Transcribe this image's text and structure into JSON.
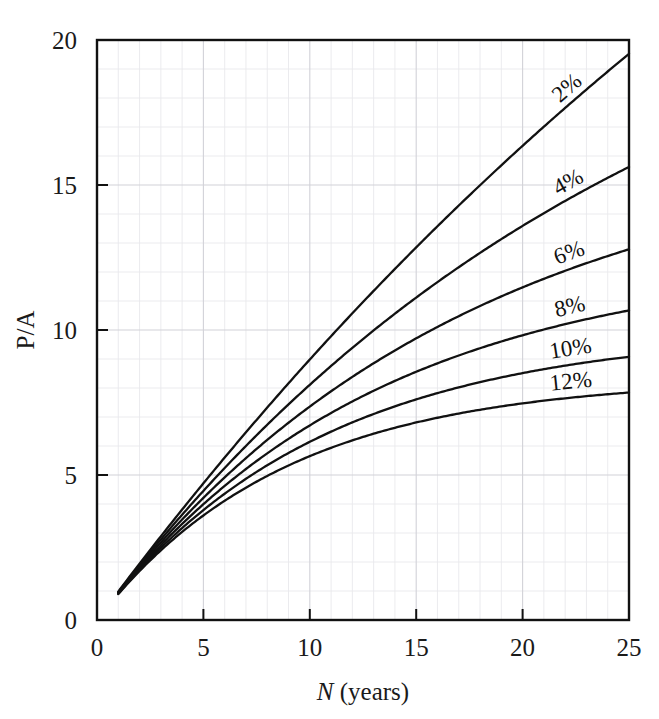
{
  "figure": {
    "background_color": "#ffffff",
    "ink_color": "#111111",
    "grid_minor_color": "#e9e9ec",
    "grid_major_color": "#d2d2d8"
  },
  "chart_data": {
    "type": "line",
    "title": "",
    "subtitle": "",
    "xlabel": "N (years)",
    "xlabel_italic_part": "N",
    "xlabel_rest": " (years)",
    "ylabel": "P/A",
    "xlim": [
      0,
      25
    ],
    "ylim": [
      0,
      20
    ],
    "xticks": [
      0,
      5,
      10,
      15,
      20,
      25
    ],
    "xtick_labels": [
      "0",
      "5",
      "10",
      "15",
      "20",
      "25"
    ],
    "yticks": [
      0,
      5,
      10,
      15,
      20
    ],
    "ytick_labels": [
      "0",
      "5",
      "10",
      "15",
      "20"
    ],
    "x_minor_step": 1,
    "y_minor_step": 1,
    "grid": true,
    "grid_style": "minor and major gridlines, light gray",
    "legend": "inline curve labels at right end of each curve",
    "legend_position": "inline-right",
    "x": [
      1,
      2,
      3,
      4,
      5,
      6,
      7,
      8,
      9,
      10,
      11,
      12,
      13,
      14,
      15,
      16,
      17,
      18,
      19,
      20,
      21,
      22,
      23,
      24,
      25
    ],
    "series": [
      {
        "name": "2%",
        "label": "2%",
        "rate": 0.02,
        "values": [
          0.98,
          1.94,
          2.88,
          3.81,
          4.71,
          5.6,
          6.47,
          7.33,
          8.16,
          8.98,
          9.79,
          10.58,
          11.35,
          12.11,
          12.85,
          13.58,
          14.29,
          14.99,
          15.68,
          16.35,
          17.01,
          17.66,
          18.29,
          18.91,
          19.52
        ]
      },
      {
        "name": "4%",
        "label": "4%",
        "rate": 0.04,
        "values": [
          0.96,
          1.89,
          2.78,
          3.63,
          4.45,
          5.24,
          6.0,
          6.73,
          7.44,
          8.11,
          8.76,
          9.39,
          9.99,
          10.56,
          11.12,
          11.65,
          12.17,
          12.66,
          13.13,
          13.59,
          14.03,
          14.45,
          14.86,
          15.25,
          15.62
        ]
      },
      {
        "name": "6%",
        "label": "6%",
        "rate": 0.06,
        "values": [
          0.94,
          1.83,
          2.67,
          3.47,
          4.21,
          4.92,
          5.58,
          6.21,
          6.8,
          7.36,
          7.89,
          8.38,
          8.85,
          9.29,
          9.71,
          10.11,
          10.48,
          10.83,
          11.16,
          11.47,
          11.76,
          12.04,
          12.3,
          12.55,
          12.78
        ]
      },
      {
        "name": "8%",
        "label": "8%",
        "rate": 0.08,
        "values": [
          0.93,
          1.78,
          2.58,
          3.31,
          3.99,
          4.62,
          5.21,
          5.75,
          6.25,
          6.71,
          7.14,
          7.54,
          7.9,
          8.24,
          8.56,
          8.85,
          9.12,
          9.37,
          9.6,
          9.82,
          10.02,
          10.2,
          10.37,
          10.53,
          10.67
        ]
      },
      {
        "name": "10%",
        "label": "10%",
        "rate": 0.1,
        "values": [
          0.91,
          1.74,
          2.49,
          3.17,
          3.79,
          4.36,
          4.87,
          5.33,
          5.76,
          6.14,
          6.5,
          6.81,
          7.1,
          7.37,
          7.61,
          7.82,
          8.02,
          8.2,
          8.36,
          8.51,
          8.65,
          8.77,
          8.88,
          8.98,
          9.08
        ]
      },
      {
        "name": "12%",
        "label": "12%",
        "rate": 0.12,
        "values": [
          0.89,
          1.69,
          2.4,
          3.04,
          3.6,
          4.11,
          4.56,
          4.97,
          5.33,
          5.65,
          5.94,
          6.19,
          6.42,
          6.63,
          6.81,
          6.97,
          7.12,
          7.25,
          7.37,
          7.47,
          7.56,
          7.64,
          7.72,
          7.78,
          7.84
        ]
      }
    ]
  }
}
